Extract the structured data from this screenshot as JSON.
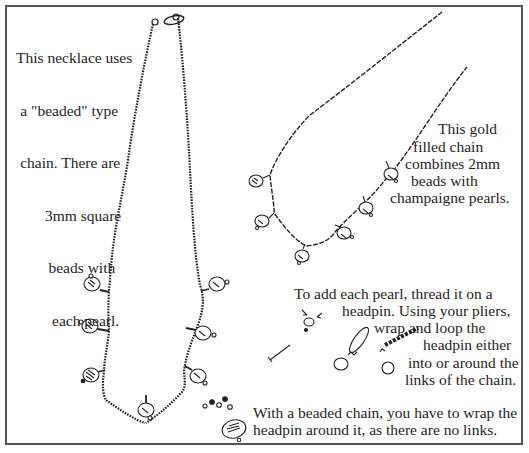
{
  "figure": {
    "captions": {
      "beaded_necklace": [
        "This necklace uses",
        "a \"beaded\" type",
        "chain. There are",
        "3mm square",
        "beads with",
        "each pearl."
      ],
      "gold_chain": [
        "This gold",
        "filled chain",
        "combines 2mm",
        "beads with",
        "champaigne pearls."
      ],
      "instructions": [
        "To add each pearl, thread it on a",
        "headpin. Using your pliers,",
        "wrap and loop the",
        "headpin either",
        "into or around the",
        "links of the chain."
      ],
      "beaded_chain_note": [
        "With a beaded chain, you have to wrap the",
        "headpin around it, as there are no links."
      ]
    },
    "illustrations": {
      "beaded_necklace_pearl_count": 7,
      "gold_chain_pearl_count": 6
    }
  }
}
